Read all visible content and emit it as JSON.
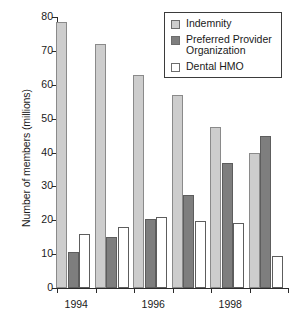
{
  "chart_data": {
    "type": "bar",
    "title": "",
    "xlabel": "",
    "ylabel": "Number of members (millions)",
    "ylim": [
      0,
      80
    ],
    "ytick_step": 10,
    "yticks": [
      0,
      10,
      20,
      30,
      40,
      50,
      60,
      70,
      80
    ],
    "ytick_labels": [
      "0",
      "10",
      "20",
      "30",
      "40",
      "50",
      "60",
      "70",
      "80"
    ],
    "grid": false,
    "legend_position": "top-right",
    "categories": [
      "1994",
      "",
      "1996",
      "",
      "1998",
      ""
    ],
    "x_visible_tick_labels": [
      "1994",
      "1996",
      "1998"
    ],
    "series": [
      {
        "name": "Indemnity",
        "color": "#cdcdcd",
        "values": [
          78.5,
          72.0,
          63.0,
          57.0,
          47.5,
          40.0
        ]
      },
      {
        "name": "Preferred Provider Organization",
        "color": "#7e7e7e",
        "values": [
          10.5,
          15.0,
          20.4,
          27.4,
          37.0,
          45.0
        ]
      },
      {
        "name": "Dental HMO",
        "color": "#ffffff",
        "values": [
          16.0,
          18.0,
          21.0,
          19.7,
          19.2,
          9.5
        ]
      }
    ]
  },
  "legend": {
    "items": [
      {
        "label": "Indemnity",
        "swatch": "indemnity"
      },
      {
        "label": "Preferred Provider Organization",
        "swatch": "ppo"
      },
      {
        "label": "Dental HMO",
        "swatch": "hmo"
      }
    ]
  },
  "axes": {
    "y_title": "Number of members (millions)"
  }
}
